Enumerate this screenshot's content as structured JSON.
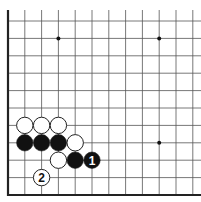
{
  "diagram": {
    "type": "go-board-corner",
    "corner": "lower-left",
    "grid": {
      "x": [
        8,
        24.8,
        41.6,
        58.4,
        75.2,
        92,
        108.8,
        125.6,
        142.4,
        159.2,
        176,
        192.8
      ],
      "y": [
        21,
        38.4,
        55.8,
        73.2,
        90.6,
        108,
        125.4,
        142.8,
        160.2,
        177.6,
        195
      ],
      "top_extent": 10,
      "right_extent": 201,
      "line_color": "#555555",
      "edge_color": "#222222"
    },
    "star_points": [
      {
        "col": 3,
        "row": 1
      },
      {
        "col": 9,
        "row": 1
      },
      {
        "col": 9,
        "row": 7
      }
    ],
    "stones": [
      {
        "color": "white",
        "col": 1,
        "row": 6,
        "label": ""
      },
      {
        "color": "white",
        "col": 2,
        "row": 6,
        "label": ""
      },
      {
        "color": "white",
        "col": 3,
        "row": 6,
        "label": ""
      },
      {
        "color": "black",
        "col": 1,
        "row": 7,
        "label": ""
      },
      {
        "color": "black",
        "col": 2,
        "row": 7,
        "label": ""
      },
      {
        "color": "black",
        "col": 3,
        "row": 7,
        "label": ""
      },
      {
        "color": "white",
        "col": 4,
        "row": 7,
        "label": ""
      },
      {
        "color": "white",
        "col": 3,
        "row": 8,
        "label": ""
      },
      {
        "color": "black",
        "col": 4,
        "row": 8,
        "label": ""
      },
      {
        "color": "black",
        "col": 5,
        "row": 8,
        "label": "1"
      },
      {
        "color": "white",
        "col": 2,
        "row": 9,
        "label": "2"
      }
    ]
  }
}
